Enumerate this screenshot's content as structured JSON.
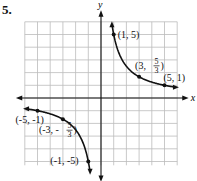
{
  "problem_number": "5.",
  "chart_data": {
    "type": "line",
    "title": "",
    "xlabel": "x",
    "ylabel": "y",
    "xlim": [
      -6,
      6
    ],
    "ylim": [
      -6,
      6
    ],
    "grid": true,
    "function": "y = 5/x",
    "series": [
      {
        "name": "branch-positive",
        "points": [
          [
            0.85,
            5.9
          ],
          [
            1,
            5
          ],
          [
            3,
            1.6667
          ],
          [
            5,
            1
          ],
          [
            5.9,
            0.85
          ]
        ]
      },
      {
        "name": "branch-negative",
        "points": [
          [
            -5.9,
            -0.85
          ],
          [
            -5,
            -1
          ],
          [
            -3,
            -1.6667
          ],
          [
            -1,
            -5
          ],
          [
            -0.85,
            -5.9
          ]
        ]
      }
    ],
    "annotations": [
      {
        "label": "(1, 5)",
        "x": 1,
        "y": 5
      },
      {
        "label_parts": [
          "(3, ",
          "5",
          "3",
          ")"
        ],
        "label": "(3, 5/3)",
        "x": 3,
        "y": 1.6667
      },
      {
        "label": "(5, 1)",
        "x": 5,
        "y": 1
      },
      {
        "label": "(-5, -1)",
        "x": -5,
        "y": -1
      },
      {
        "label_parts": [
          "(-3, -",
          "5",
          "3",
          ")"
        ],
        "label": "(-3, -5/3)",
        "x": -3,
        "y": -1.6667
      },
      {
        "label": "(-1, -5)",
        "x": -1,
        "y": -5
      }
    ]
  }
}
